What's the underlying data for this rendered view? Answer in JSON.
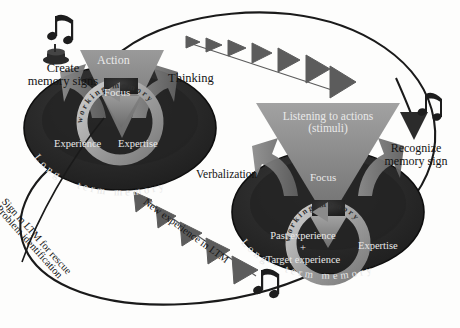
{
  "diagram": {
    "colors": {
      "background": "#fdfdfc",
      "disc_dark": "#262626",
      "disc_rim": "#3d3d3d",
      "disc_edge": "#121212",
      "arrow_gray": "#5d5d5d",
      "triangle_light": "#8e8e8e",
      "triangle_mid": "#737373",
      "ring_gray": "#a8a8a8",
      "outline": "#1a1a1a",
      "text_dark": "#141414",
      "text_light": "#e9e9e9"
    },
    "left_unit": {
      "triangle_label": "Action",
      "focus_label": "Focus",
      "ring_label": "working memory",
      "ltm_label": "Long - term memory",
      "disc_items": [
        "Experience",
        "Expertise"
      ]
    },
    "right_unit": {
      "triangle_label_line1": "Listening to actions",
      "triangle_label_line2": "(stimuli)",
      "focus_label": "Focus",
      "ring_label": "working memory",
      "ltm_label": "Long - term memory",
      "disc_items": [
        "Past experience",
        "+",
        "Target experience",
        "Expertise"
      ]
    },
    "labels": {
      "create_memory_signs_line1": "Create",
      "create_memory_signs_line2": "memory signs",
      "thinking": "Thinking",
      "recognize_line1": "Recognize",
      "recognize_line2": "memory sign",
      "verbalization": "Verbalization",
      "new_experience": "New experience in LTM",
      "sign_in_ltm": "Sign in LTM for rescue",
      "problem_identification": "Problem identification"
    },
    "icons": {
      "music_note_top_left": "music-note-icon",
      "music_note_top_right": "music-note-icon",
      "music_note_bottom": "music-note-icon",
      "speaker": "speaker-icon"
    }
  }
}
